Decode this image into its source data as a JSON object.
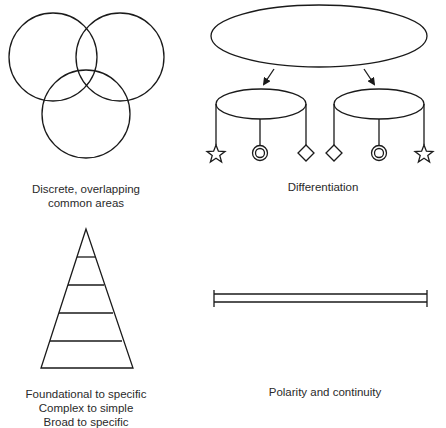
{
  "panels": {
    "overlap": {
      "caption_lines": [
        "Discrete, overlapping",
        "common areas"
      ],
      "shapes": [
        "circle",
        "circle",
        "circle"
      ]
    },
    "differentiation": {
      "caption_lines": [
        "Differentiation"
      ],
      "parent": "ellipse",
      "children": [
        {
          "node": "ellipse",
          "pendants": [
            "star",
            "double-circle",
            "diamond"
          ]
        },
        {
          "node": "ellipse",
          "pendants": [
            "diamond",
            "double-circle",
            "star"
          ]
        }
      ]
    },
    "hierarchy": {
      "caption_lines": [
        "Foundational to specific",
        "Complex to simple",
        "Broad to specific"
      ],
      "shape": "layered-triangle",
      "layers": 5
    },
    "polarity": {
      "caption_lines": [
        "Polarity and continuity"
      ],
      "shape": "double-line-with-end-caps"
    }
  },
  "colors": {
    "stroke": "#1a1a1a",
    "text": "#2a2a2a",
    "background": "#ffffff"
  }
}
